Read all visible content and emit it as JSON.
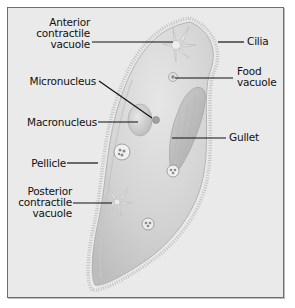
{
  "diagram": {
    "frame_background": "#eaeaea",
    "body_color": "#d4d4d4",
    "labels": {
      "anterior_contractile_vacuole": [
        "Anterior",
        "contractile",
        "vacuole"
      ],
      "micronucleus": "Micronucleus",
      "macronucleus": "Macronucleus",
      "pellicle": "Pellicle",
      "posterior_contractile_vacuole": [
        "Posterior",
        "contractile",
        "vacuole"
      ],
      "cilia": "Cilia",
      "food_vacuole": [
        "Food",
        "vacuole"
      ],
      "gullet": "Gullet"
    }
  }
}
